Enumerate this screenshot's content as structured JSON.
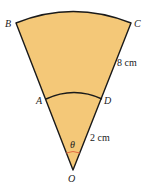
{
  "figure": {
    "type": "annular-sector",
    "fill_color": "#F4C878",
    "stroke_color": "#1a1a1a",
    "angle_marker_color": "#E0603A",
    "points": {
      "O": "O",
      "A": "A",
      "B": "B",
      "C": "C",
      "D": "D"
    },
    "angle_label": "θ",
    "measurements": {
      "DC": "8 cm",
      "OD": "2 cm"
    }
  }
}
